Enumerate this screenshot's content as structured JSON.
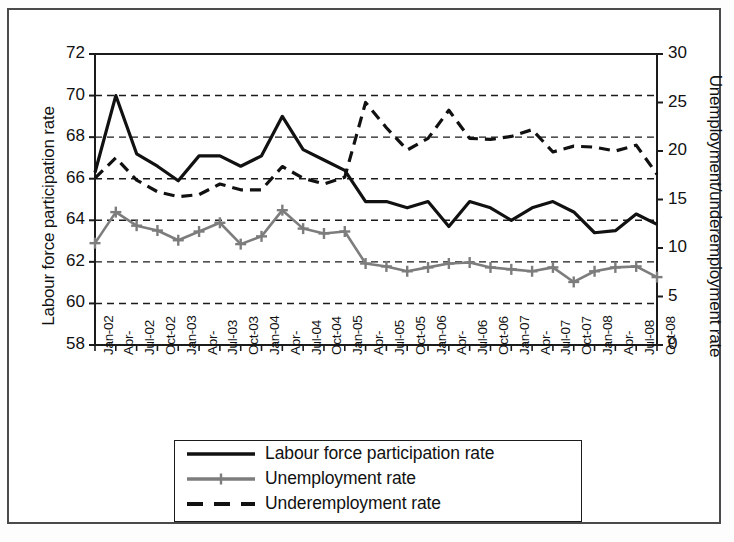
{
  "figure": {
    "background_color": "#ffffff",
    "frame_color": "#4a4a4a"
  },
  "chart_data": {
    "type": "line",
    "title": "",
    "subtitle": "",
    "xlabel": "",
    "ylabel": "Labour force participation rate",
    "y2label": "Unemployment/underemployment rate",
    "ylim": [
      58,
      72
    ],
    "y2lim": [
      0,
      30
    ],
    "yticks": [
      58,
      60,
      62,
      64,
      66,
      68,
      70,
      72
    ],
    "y2ticks": [
      0,
      5,
      10,
      15,
      20,
      25,
      30
    ],
    "grid": "horizontal-dashed",
    "legend_position": "below-plot",
    "x": [
      "Jan-02",
      "Apr-",
      "Jul-02",
      "Oct-02",
      "Jan-03",
      "Apr-",
      "Jul-03",
      "Oct-03",
      "Jan-04",
      "Apr-",
      "Jul-04",
      "Oct-04",
      "Jan-05",
      "Apr-",
      "Jul-05",
      "Oct-05",
      "Jan-06",
      "Apr-",
      "Jul-06",
      "Oct-06",
      "Jan-07",
      "Apr-",
      "Jul-07",
      "Oct-07",
      "Jan-08",
      "Apr-",
      "Jul-08",
      "Oct-08"
    ],
    "series": [
      {
        "name": "Labour force participation rate",
        "axis": "left",
        "color": "#111111",
        "style": "solid",
        "marker": "none",
        "width": 3.2,
        "values": [
          66.3,
          70.0,
          67.2,
          66.6,
          65.9,
          67.1,
          67.1,
          66.6,
          67.1,
          69.0,
          67.4,
          66.9,
          66.4,
          64.9,
          64.9,
          64.6,
          64.9,
          63.7,
          64.9,
          64.6,
          64.0,
          64.6,
          64.9,
          64.4,
          63.4,
          63.5,
          64.3,
          63.8
        ]
      },
      {
        "name": "Unemployment rate",
        "axis": "right",
        "color": "#7d7d7d",
        "style": "solid",
        "marker": "plus",
        "width": 2.6,
        "values": [
          10.5,
          13.7,
          12.3,
          11.8,
          10.8,
          11.7,
          12.6,
          10.4,
          11.2,
          13.9,
          12.0,
          11.5,
          11.7,
          8.4,
          8.1,
          7.6,
          8.0,
          8.4,
          8.5,
          8.0,
          7.8,
          7.6,
          8.0,
          6.5,
          7.6,
          8.0,
          8.1,
          7.0
        ]
      },
      {
        "name": "Underemployment rate",
        "axis": "right",
        "color": "#111111",
        "style": "dashed",
        "marker": "none",
        "width": 3.2,
        "values": [
          17.2,
          19.3,
          17.0,
          15.8,
          15.3,
          15.5,
          16.6,
          16.0,
          16.0,
          18.4,
          17.2,
          16.6,
          17.3,
          25.0,
          22.4,
          20.1,
          21.3,
          24.2,
          21.3,
          21.2,
          21.5,
          22.2,
          19.9,
          20.5,
          20.4,
          20.0,
          20.6,
          17.6
        ]
      }
    ]
  },
  "legend": {
    "items": [
      {
        "label": "Labour force participation rate",
        "style": "solid",
        "color": "#111111",
        "marker": "none"
      },
      {
        "label": "Unemployment rate",
        "style": "solid",
        "color": "#7d7d7d",
        "marker": "plus"
      },
      {
        "label": "Underemployment rate",
        "style": "dashed",
        "color": "#111111",
        "marker": "none"
      }
    ]
  }
}
